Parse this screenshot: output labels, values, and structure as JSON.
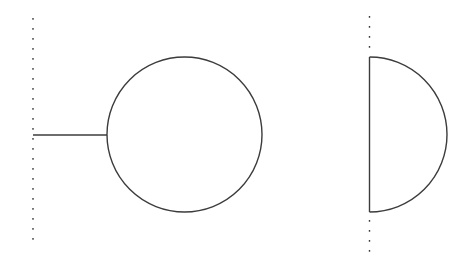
{
  "canvas": {
    "width": 468,
    "height": 267,
    "background": "#ffffff",
    "stroke_color": "#3c3c3c",
    "stroke_width": 1.4,
    "dot_dasharray": "1.8 8.2"
  },
  "figures": [
    {
      "name": "tadpole-diagram",
      "elements": [
        {
          "name": "left-boundary-dotted-line",
          "type": "dotted-line",
          "x1": 33,
          "y1": 18,
          "x2": 33,
          "y2": 248
        },
        {
          "name": "tadpole-stem-line",
          "type": "line",
          "x1": 33,
          "y1": 135,
          "x2": 107,
          "y2": 135
        },
        {
          "name": "tadpole-loop-circle",
          "type": "circle",
          "cx": 184.5,
          "cy": 134.5,
          "r": 77.5
        }
      ]
    },
    {
      "name": "boundary-half-loop-diagram",
      "elements": [
        {
          "name": "right-boundary-dotted-line-upper",
          "type": "dotted-line",
          "x1": 369.5,
          "y1": 16,
          "x2": 369.5,
          "y2": 50
        },
        {
          "name": "right-boundary-dotted-line-lower",
          "type": "dotted-line",
          "x1": 369.5,
          "y1": 220,
          "x2": 369.5,
          "y2": 253
        },
        {
          "name": "half-loop-flat-edge-line",
          "type": "line",
          "x1": 369.5,
          "y1": 57,
          "x2": 369.5,
          "y2": 212
        },
        {
          "name": "half-loop-arc",
          "type": "arc",
          "x1": 369.5,
          "y1": 57,
          "x2": 369.5,
          "y2": 212,
          "r": 77.5,
          "sweep": 1
        }
      ]
    }
  ]
}
